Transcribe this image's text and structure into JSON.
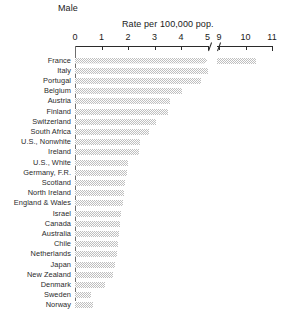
{
  "chart_data": {
    "type": "bar",
    "orientation": "horizontal",
    "title": "Male",
    "xlabel": "Rate per 100,000 pop.",
    "ylabel": "",
    "grid": false,
    "legend": null,
    "axis_break": {
      "after": 5,
      "before": 9
    },
    "xlim": [
      0,
      11
    ],
    "xticks": [
      0,
      1,
      2,
      3,
      4,
      5,
      9,
      10,
      11
    ],
    "xticklabels": [
      "0",
      "1",
      "2",
      "3",
      "4",
      "5",
      "9",
      "10",
      "11"
    ],
    "categories": [
      "France",
      "Italy",
      "Portugal",
      "Belgium",
      "Austria",
      "Finland",
      "Switzerland",
      "South Africa",
      "U.S., Nonwhite",
      "Ireland",
      "U.S., White",
      "Germany, F.R.",
      "Scotland",
      "North Ireland",
      "England & Wales",
      "Israel",
      "Canada",
      "Australia",
      "Chile",
      "Netherlands",
      "Japan",
      "New Zealand",
      "Denmark",
      "Sweden",
      "Norway"
    ],
    "values": [
      10.4,
      5.0,
      4.75,
      4.05,
      3.6,
      3.5,
      3.05,
      2.8,
      2.45,
      2.4,
      2.0,
      1.95,
      1.9,
      1.85,
      1.8,
      1.75,
      1.7,
      1.66,
      1.62,
      1.58,
      1.5,
      1.44,
      1.15,
      0.59,
      0.69
    ],
    "bar_color": "#bfbfbf",
    "axis_color": "#2b2b2b"
  },
  "axis": {
    "break_symbol": "axis-break-slash"
  }
}
